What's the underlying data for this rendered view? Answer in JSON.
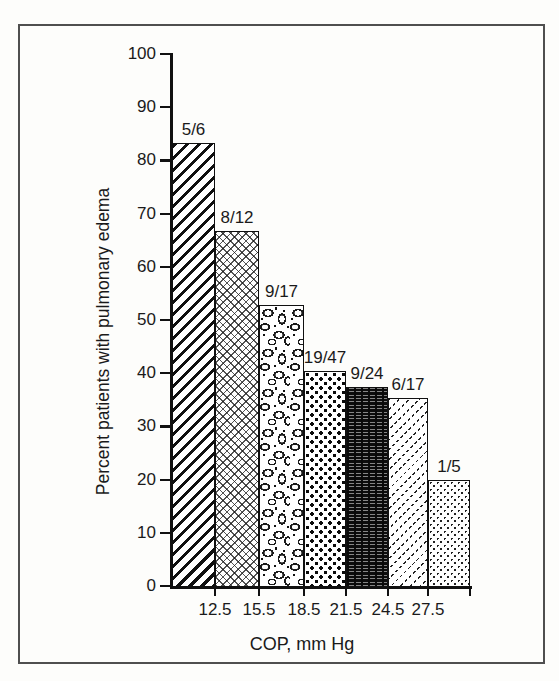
{
  "chart_data": {
    "type": "bar",
    "title": "",
    "xlabel": "COP, mm Hg",
    "ylabel": "Percent patients with pulmonary edema",
    "ylim": [
      0,
      100
    ],
    "y_ticks": [
      0,
      10,
      20,
      30,
      40,
      50,
      60,
      70,
      80,
      90,
      100
    ],
    "x_boundary_labels": [
      "12.5",
      "15.5",
      "18.5",
      "21.5",
      "24.5",
      "27.5"
    ],
    "grid": false,
    "legend": "none",
    "bars": [
      {
        "label": "5/6",
        "numerator": 5,
        "denominator": 6,
        "value_pct": 83.3,
        "pattern": "diagonal-stripes"
      },
      {
        "label": "8/12",
        "numerator": 8,
        "denominator": 12,
        "value_pct": 66.7,
        "pattern": "crosshatch"
      },
      {
        "label": "9/17",
        "numerator": 9,
        "denominator": 17,
        "value_pct": 52.9,
        "pattern": "pebbles"
      },
      {
        "label": "19/47",
        "numerator": 19,
        "denominator": 47,
        "value_pct": 40.4,
        "pattern": "checker-squares"
      },
      {
        "label": "9/24",
        "numerator": 9,
        "denominator": 24,
        "value_pct": 37.5,
        "pattern": "dark-noise"
      },
      {
        "label": "6/17",
        "numerator": 6,
        "denominator": 17,
        "value_pct": 35.3,
        "pattern": "diagonal-dashes"
      },
      {
        "label": "1/5",
        "numerator": 1,
        "denominator": 5,
        "value_pct": 20.0,
        "pattern": "fine-dots"
      }
    ],
    "colors": {
      "ink": "#1a1a1a",
      "paper": "#fdfdfb",
      "frame_border": "#4f4f4f"
    }
  }
}
